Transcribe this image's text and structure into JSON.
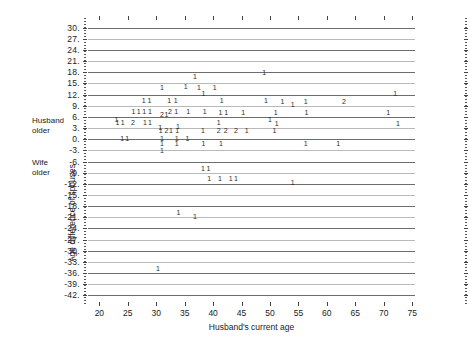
{
  "chart_data": {
    "type": "scatter",
    "title": "",
    "xlabel": "Husband's current age",
    "ylabel": "Age difference of spouses",
    "xlim": [
      18,
      75.5
    ],
    "ylim": [
      -43.5,
      31.5
    ],
    "grid": true,
    "legend_position": "none",
    "xticks": [
      20,
      25,
      30,
      35,
      40,
      45,
      50,
      55,
      60,
      65,
      70,
      75
    ],
    "yticks": [
      30,
      27,
      24,
      21,
      18,
      15,
      12,
      9,
      6,
      3,
      0,
      -3,
      -6,
      -9,
      -12,
      -15,
      -18,
      -21,
      -24,
      -27,
      -30,
      -33,
      -36,
      -39,
      -42
    ],
    "ytick_labels": [
      "30.",
      "27.",
      "24.",
      "21.",
      "18.",
      "15.",
      "12.",
      "9.",
      "6.",
      "3.",
      "0.",
      "-3.",
      "-6.",
      "-9.",
      "-12.",
      "-15.",
      "-18.",
      "-21.",
      "-24.",
      "-27.",
      "-30.",
      "-33.",
      "-36.",
      "-39.",
      "-42."
    ],
    "xtick_labels": [
      "20",
      "25",
      "30",
      "35",
      "40",
      "45",
      "50",
      "55",
      "60",
      "65",
      "70",
      "75"
    ],
    "annotations": [
      {
        "text": "Husband\nolder",
        "line1": "Husband",
        "line2": "older",
        "x": 18,
        "y": 5.0
      },
      {
        "text": "Wife\nolder",
        "line1": "Wife",
        "line2": "older",
        "x": 18,
        "y": -5.5
      }
    ],
    "marker_style": "count-digit",
    "points": [
      {
        "x": 36.8,
        "y": 17.0,
        "label": "1"
      },
      {
        "x": 49.0,
        "y": 18.0,
        "label": "1"
      },
      {
        "x": 31.0,
        "y": 14.0,
        "label": "1"
      },
      {
        "x": 35.2,
        "y": 14.2,
        "label": "1"
      },
      {
        "x": 37.5,
        "y": 14.1,
        "label": "1"
      },
      {
        "x": 40.3,
        "y": 14.0,
        "label": "1"
      },
      {
        "x": 38.3,
        "y": 12.3,
        "label": "1"
      },
      {
        "x": 72.0,
        "y": 12.3,
        "label": "1"
      },
      {
        "x": 27.8,
        "y": 10.5,
        "label": "1"
      },
      {
        "x": 28.8,
        "y": 10.5,
        "label": "1"
      },
      {
        "x": 32.3,
        "y": 10.5,
        "label": "1"
      },
      {
        "x": 33.4,
        "y": 10.5,
        "label": "1"
      },
      {
        "x": 41.5,
        "y": 10.4,
        "label": "1"
      },
      {
        "x": 49.3,
        "y": 10.4,
        "label": "1"
      },
      {
        "x": 52.2,
        "y": 10.3,
        "label": "1"
      },
      {
        "x": 54.0,
        "y": 9.4,
        "label": "1"
      },
      {
        "x": 56.3,
        "y": 10.2,
        "label": "1"
      },
      {
        "x": 63.0,
        "y": 10.2,
        "label": "2"
      },
      {
        "x": 26.0,
        "y": 7.7,
        "label": "1"
      },
      {
        "x": 26.9,
        "y": 7.7,
        "label": "1"
      },
      {
        "x": 27.9,
        "y": 7.7,
        "label": "1"
      },
      {
        "x": 28.9,
        "y": 7.7,
        "label": "1"
      },
      {
        "x": 31.0,
        "y": 6.8,
        "label": "2"
      },
      {
        "x": 32.4,
        "y": 7.6,
        "label": "2"
      },
      {
        "x": 33.5,
        "y": 7.6,
        "label": "1"
      },
      {
        "x": 31.8,
        "y": 6.8,
        "label": "1"
      },
      {
        "x": 35.6,
        "y": 7.5,
        "label": "1"
      },
      {
        "x": 38.5,
        "y": 7.5,
        "label": "1"
      },
      {
        "x": 41.3,
        "y": 7.4,
        "label": "1"
      },
      {
        "x": 42.3,
        "y": 7.4,
        "label": "1"
      },
      {
        "x": 45.3,
        "y": 7.4,
        "label": "1"
      },
      {
        "x": 51.0,
        "y": 7.3,
        "label": "1"
      },
      {
        "x": 56.4,
        "y": 7.2,
        "label": "1"
      },
      {
        "x": 70.8,
        "y": 7.2,
        "label": "1"
      },
      {
        "x": 23.0,
        "y": 5.5,
        "label": "1"
      },
      {
        "x": 23.2,
        "y": 4.6,
        "label": "1"
      },
      {
        "x": 24.1,
        "y": 4.6,
        "label": "1"
      },
      {
        "x": 25.9,
        "y": 4.6,
        "label": "2"
      },
      {
        "x": 28.0,
        "y": 4.6,
        "label": "1"
      },
      {
        "x": 28.9,
        "y": 4.6,
        "label": "1"
      },
      {
        "x": 41.0,
        "y": 4.5,
        "label": "1"
      },
      {
        "x": 50.0,
        "y": 5.3,
        "label": "1"
      },
      {
        "x": 51.2,
        "y": 4.3,
        "label": "1"
      },
      {
        "x": 72.5,
        "y": 4.3,
        "label": "1"
      },
      {
        "x": 30.7,
        "y": 3.4,
        "label": "1"
      },
      {
        "x": 33.8,
        "y": 3.5,
        "label": "1"
      },
      {
        "x": 38.2,
        "y": 2.4,
        "label": "1"
      },
      {
        "x": 30.8,
        "y": 2.4,
        "label": "1"
      },
      {
        "x": 31.8,
        "y": 2.4,
        "label": "2"
      },
      {
        "x": 32.6,
        "y": 2.4,
        "label": "1"
      },
      {
        "x": 33.7,
        "y": 2.4,
        "label": "1"
      },
      {
        "x": 41.0,
        "y": 2.4,
        "label": "2"
      },
      {
        "x": 42.2,
        "y": 2.4,
        "label": "2"
      },
      {
        "x": 44.0,
        "y": 2.4,
        "label": "2"
      },
      {
        "x": 45.9,
        "y": 2.4,
        "label": "1"
      },
      {
        "x": 50.8,
        "y": 2.4,
        "label": "1"
      },
      {
        "x": 24.0,
        "y": 0.3,
        "label": "1"
      },
      {
        "x": 24.9,
        "y": 0.3,
        "label": "1"
      },
      {
        "x": 31.0,
        "y": 0.3,
        "label": "1"
      },
      {
        "x": 33.6,
        "y": 0.3,
        "label": "1"
      },
      {
        "x": 35.5,
        "y": 0.3,
        "label": "1"
      },
      {
        "x": 31.0,
        "y": -1.0,
        "label": "1"
      },
      {
        "x": 33.6,
        "y": -1.0,
        "label": "1"
      },
      {
        "x": 38.3,
        "y": -1.0,
        "label": "1"
      },
      {
        "x": 41.4,
        "y": -1.0,
        "label": "1"
      },
      {
        "x": 56.3,
        "y": -1.0,
        "label": "1"
      },
      {
        "x": 62.0,
        "y": -1.0,
        "label": "1"
      },
      {
        "x": 31.0,
        "y": -2.8,
        "label": "1"
      },
      {
        "x": 38.2,
        "y": -7.8,
        "label": "1"
      },
      {
        "x": 39.2,
        "y": -7.8,
        "label": "1"
      },
      {
        "x": 39.3,
        "y": -10.4,
        "label": "1"
      },
      {
        "x": 41.2,
        "y": -10.4,
        "label": "1"
      },
      {
        "x": 43.1,
        "y": -10.4,
        "label": "1"
      },
      {
        "x": 44.0,
        "y": -10.4,
        "label": "1"
      },
      {
        "x": 54.0,
        "y": -11.5,
        "label": "1"
      },
      {
        "x": 33.9,
        "y": -19.5,
        "label": "1"
      },
      {
        "x": 36.8,
        "y": -20.7,
        "label": "1"
      },
      {
        "x": 30.3,
        "y": -34.6,
        "label": "1"
      }
    ]
  }
}
